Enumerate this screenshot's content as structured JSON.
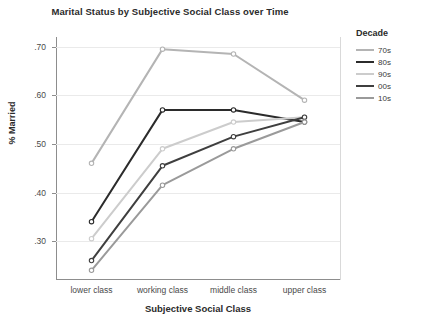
{
  "chart_data": {
    "type": "line",
    "title": "Marital Status by Subjective Social Class over Time",
    "xlabel": "Subjective Social Class",
    "ylabel": "% Married",
    "categories": [
      "lower class",
      "working class",
      "middle class",
      "upper class"
    ],
    "ylim": [
      0.22,
      0.72
    ],
    "yticks": [
      ".70",
      ".60",
      ".50",
      ".40",
      ".30"
    ],
    "ytick_values": [
      0.7,
      0.6,
      0.5,
      0.4,
      0.3
    ],
    "grid": true,
    "legend_position": "right",
    "legend_title": "Decade",
    "series": [
      {
        "name": "70s",
        "color": "#b4b4b4",
        "values": [
          0.46,
          0.695,
          0.685,
          0.59
        ]
      },
      {
        "name": "80s",
        "color": "#2b2b2b",
        "values": [
          0.34,
          0.57,
          0.57,
          0.545
        ]
      },
      {
        "name": "90s",
        "color": "#cccccc",
        "values": [
          0.305,
          0.49,
          0.545,
          0.555
        ]
      },
      {
        "name": "00s",
        "color": "#3f3f3f",
        "values": [
          0.26,
          0.455,
          0.515,
          0.555
        ]
      },
      {
        "name": "10s",
        "color": "#9a9a9a",
        "values": [
          0.24,
          0.415,
          0.49,
          0.545
        ]
      }
    ]
  }
}
